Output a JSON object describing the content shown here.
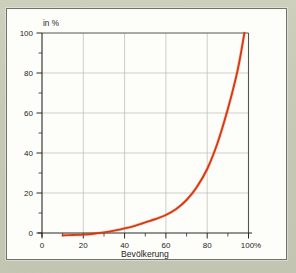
{
  "card": {
    "background_color": "#fdfdfa",
    "border_color": "#6f7368",
    "mat_color": "#c9ccb8"
  },
  "source": {
    "text": "Quelle: Statistisches Bundesamt"
  },
  "chart_data": {
    "type": "line",
    "title": "",
    "subtitle": "",
    "xlabel": "Bevölkerung",
    "ylabel": "in %",
    "ylabel_position": "top-left",
    "xlim": [
      0,
      104
    ],
    "ylim": [
      -4,
      100
    ],
    "grid": true,
    "grid_axes": "both",
    "legend": false,
    "legend_position": "none",
    "series_color": "#d83a10",
    "x_ticks": [
      0,
      20,
      40,
      60,
      80,
      100
    ],
    "x_tick_labels": [
      "0",
      "20",
      "40",
      "60",
      "80",
      "100%"
    ],
    "x_minor_ticks": [
      10,
      30,
      50,
      70,
      90
    ],
    "y_ticks": [
      0,
      20,
      40,
      60,
      80,
      100
    ],
    "y_tick_labels": [
      "0",
      "20",
      "40",
      "60",
      "80",
      "100"
    ],
    "y_minor_ticks": [
      10,
      30,
      50,
      70,
      90
    ],
    "x_gridlines": [
      20,
      40,
      60,
      80
    ],
    "y_gridlines": [
      20,
      40,
      60,
      80
    ],
    "series": [
      {
        "name": "Vermögensverteilung",
        "x": [
          10,
          15,
          20,
          25,
          30,
          35,
          40,
          45,
          50,
          55,
          60,
          65,
          70,
          75,
          80,
          85,
          90,
          94,
          96,
          98
        ],
        "values": [
          -1.2,
          -1.0,
          -0.8,
          -0.4,
          0.3,
          1.2,
          2.3,
          3.6,
          5.3,
          7.0,
          9.0,
          12.0,
          16.5,
          23.0,
          32.0,
          45.0,
          62.0,
          78.0,
          88.0,
          100.0
        ]
      }
    ]
  }
}
